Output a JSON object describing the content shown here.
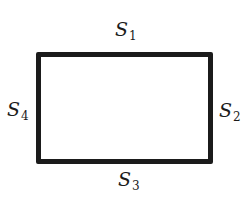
{
  "figure": {
    "shape": "rectangle",
    "stroke_color": "#1b1b1b",
    "background_color": "#ffffff",
    "labels": {
      "top": {
        "base": "S",
        "sub": "1"
      },
      "right": {
        "base": "S",
        "sub": "2"
      },
      "bottom": {
        "base": "S",
        "sub": "3"
      },
      "left": {
        "base": "S",
        "sub": "4"
      }
    }
  }
}
